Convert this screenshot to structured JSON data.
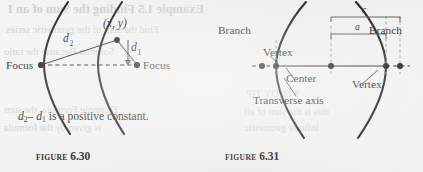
{
  "page": {
    "width": 423,
    "height": 172,
    "background_color": "#efefef",
    "ink_color": "#111111"
  },
  "showthrough": {
    "note": "faint mirrored text bleeding through from reverse side of scanned page",
    "lines": [
      {
        "text": "Example 1.5  Finding the Sum of an I",
        "x": 8,
        "y": 2,
        "style": "head"
      },
      {
        "text": "Find the sum of the geometric series",
        "x": 6,
        "y": 24,
        "style": "body"
      },
      {
        "text": "Solution  Because the ratio",
        "x": 4,
        "y": 46,
        "style": "body"
      },
      {
        "text": "Example  Formula, the sum",
        "x": 4,
        "y": 104,
        "style": "body"
      },
      {
        "text": "is given by the formula",
        "x": 4,
        "y": 122,
        "style": "body"
      },
      {
        "text": "STUDY TIP",
        "x": 246,
        "y": 88,
        "style": "body"
      },
      {
        "text": "this is the sum of all",
        "x": 244,
        "y": 106,
        "style": "body"
      },
      {
        "text": "infinite geometric",
        "x": 244,
        "y": 122,
        "style": "body"
      }
    ]
  },
  "figures": [
    {
      "id": "figure-6-30",
      "caption_wordmark": "FIGURE",
      "caption_number": "6.30",
      "caption_x": 36,
      "caption_y": 147,
      "description_text": {
        "prefix_var": "d",
        "prefix_sub": "2",
        "minus": "–",
        "second_var": "d",
        "second_sub": "1",
        "suffix": " is a positive constant.",
        "x": 18,
        "y": 118
      },
      "labels": [
        {
          "name": "point-label-xy",
          "text": "(x, y)",
          "x": 108,
          "y": 18
        },
        {
          "name": "focus-left-label",
          "text": "Focus",
          "x": 8,
          "y": 70
        },
        {
          "name": "focus-right-label",
          "text": "Focus",
          "x": 150,
          "y": 70
        },
        {
          "name": "distance-d2",
          "text": "d",
          "sub": "2",
          "x": 62,
          "y": 44
        },
        {
          "name": "distance-d1",
          "text": "d",
          "sub": "1",
          "x": 133,
          "y": 45
        }
      ]
    },
    {
      "id": "figure-6-31",
      "caption_wordmark": "FIGURE",
      "caption_number": "6.31",
      "caption_x": 225,
      "caption_y": 147,
      "labels": [
        {
          "name": "branch-left-label",
          "text": "Branch",
          "x": 222,
          "y": 30
        },
        {
          "name": "branch-right-label",
          "text": "Branch",
          "x": 372,
          "y": 30
        },
        {
          "name": "vertex-left-label",
          "text": "Vertex",
          "x": 266,
          "y": 52
        },
        {
          "name": "vertex-right-label",
          "text": "Vertex",
          "x": 352,
          "y": 80
        },
        {
          "name": "center-label",
          "text": "Center",
          "x": 285,
          "y": 75
        },
        {
          "name": "transverse-axis-label",
          "text": "Transverse axis",
          "x": 253,
          "y": 101
        },
        {
          "name": "bracket-c-label",
          "text": "c",
          "x": 333,
          "y": 20
        },
        {
          "name": "bracket-a-label",
          "text": "a",
          "x": 322,
          "y": 36
        }
      ]
    }
  ]
}
